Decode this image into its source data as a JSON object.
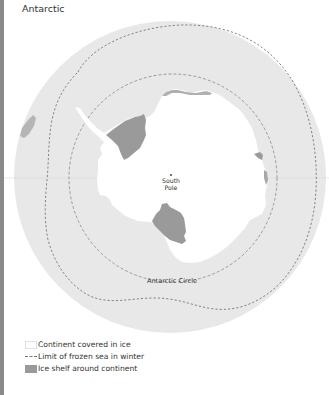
{
  "title": "Antarctic",
  "map": {
    "labels": {
      "south_pole_line1": "South",
      "south_pole_line2": "Pole",
      "antarctic_circle": "Antarctic Circle"
    },
    "colors": {
      "ocean": "#e8e8e8",
      "continent": "#ffffff",
      "ice_shelf": "#9a9a9a",
      "dashed_line": "#777777",
      "left_bar": "#8a8a8a"
    }
  },
  "legend": {
    "items": [
      {
        "key": "continent",
        "label": "Continent covered in ice"
      },
      {
        "key": "frozen-sea-limit",
        "label": "Limit of frozen sea in winter"
      },
      {
        "key": "ice-shelf",
        "label": "Ice shelf around continent"
      }
    ]
  }
}
